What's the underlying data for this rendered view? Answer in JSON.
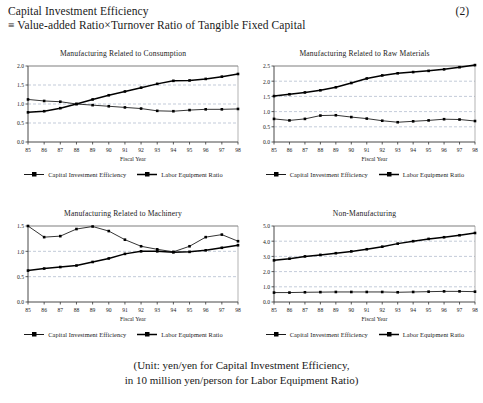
{
  "equation": {
    "line1": "Capital Investment Efficiency",
    "line2": "≡ Value‐added Ratio×Turnover Ratio of  Tangible Fixed Capital",
    "number": "(2)"
  },
  "legend": {
    "series1_label": "Capital Investment Efficiency",
    "series2_label": "Labor Equipment Ratio",
    "marker_icon": "filled-square-marker"
  },
  "footer": {
    "line1": "(Unit: yen/yen for Capital Investment Efficiency,",
    "line2": "in 10 million yen/person for Labor Equipment Ratio)"
  },
  "axis": {
    "xlabel": "Fiscal Year",
    "categories": [
      "85",
      "86",
      "87",
      "88",
      "89",
      "90",
      "91",
      "92",
      "93",
      "94",
      "95",
      "96",
      "97",
      "98"
    ]
  },
  "colors": {
    "line": "#000000",
    "grid": "#9aa7bf",
    "frame": "#808080",
    "text": "#1a1a1a"
  },
  "chart_data": [
    {
      "id": "consumption",
      "type": "line",
      "title": "Manufacturing Related to Consumption",
      "xlabel": "Fiscal Year",
      "ylabel": "",
      "categories": [
        "85",
        "86",
        "87",
        "88",
        "89",
        "90",
        "91",
        "92",
        "93",
        "94",
        "95",
        "96",
        "97",
        "98"
      ],
      "yticks": [
        0.0,
        0.5,
        1.0,
        1.5,
        2.0
      ],
      "ytick_labels": [
        "0.0",
        "0.5",
        "1.0",
        "1.5",
        "2.0"
      ],
      "ylim": [
        0.0,
        2.0
      ],
      "grid": true,
      "legend_position": "bottom",
      "series": [
        {
          "name": "Capital Investment Efficiency",
          "values": [
            1.12,
            1.08,
            1.06,
            1.0,
            0.97,
            0.94,
            0.91,
            0.88,
            0.82,
            0.81,
            0.84,
            0.86,
            0.86,
            0.87
          ]
        },
        {
          "name": "Labor Equipment Ratio",
          "values": [
            0.78,
            0.81,
            0.89,
            1.0,
            1.12,
            1.23,
            1.33,
            1.43,
            1.53,
            1.61,
            1.62,
            1.66,
            1.72,
            1.79
          ]
        }
      ]
    },
    {
      "id": "raw-materials",
      "type": "line",
      "title": "Manufacturing Related to Raw Materials",
      "xlabel": "Fiscal Year",
      "ylabel": "",
      "categories": [
        "85",
        "86",
        "87",
        "88",
        "89",
        "90",
        "91",
        "92",
        "93",
        "94",
        "95",
        "96",
        "97",
        "98"
      ],
      "yticks": [
        0.0,
        0.5,
        1.0,
        1.5,
        2.0,
        2.5
      ],
      "ytick_labels": [
        "0.0",
        "0.5",
        "1.0",
        "1.5",
        "2.0",
        "2.5"
      ],
      "ylim": [
        0.0,
        2.5
      ],
      "grid": true,
      "legend_position": "bottom",
      "series": [
        {
          "name": "Capital Investment Efficiency",
          "values": [
            0.76,
            0.71,
            0.76,
            0.87,
            0.88,
            0.82,
            0.77,
            0.7,
            0.65,
            0.68,
            0.71,
            0.75,
            0.74,
            0.69
          ]
        },
        {
          "name": "Labor Equipment Ratio",
          "values": [
            1.51,
            1.57,
            1.63,
            1.7,
            1.8,
            1.94,
            2.09,
            2.19,
            2.26,
            2.3,
            2.34,
            2.39,
            2.46,
            2.53
          ]
        }
      ]
    },
    {
      "id": "machinery",
      "type": "line",
      "title": "Manufacturing Related to Machinery",
      "xlabel": "Fiscal Year",
      "ylabel": "",
      "categories": [
        "85",
        "86",
        "87",
        "88",
        "89",
        "90",
        "91",
        "92",
        "93",
        "94",
        "95",
        "96",
        "97",
        "98"
      ],
      "yticks": [
        0.0,
        0.5,
        1.0,
        1.5
      ],
      "ytick_labels": [
        "0.0",
        "0.5",
        "1.0",
        "1.5"
      ],
      "ylim": [
        0.0,
        1.5
      ],
      "grid": true,
      "legend_position": "bottom",
      "series": [
        {
          "name": "Capital Investment Efficiency",
          "values": [
            1.5,
            1.28,
            1.3,
            1.44,
            1.49,
            1.4,
            1.23,
            1.1,
            1.04,
            0.99,
            1.1,
            1.28,
            1.33,
            1.2
          ]
        },
        {
          "name": "Labor Equipment Ratio",
          "values": [
            0.62,
            0.66,
            0.69,
            0.72,
            0.79,
            0.86,
            0.95,
            1.0,
            1.0,
            0.98,
            0.99,
            1.02,
            1.07,
            1.12
          ]
        }
      ]
    },
    {
      "id": "non-manufacturing",
      "type": "line",
      "title": "Non-Manufacturing",
      "xlabel": "Fiscal Year",
      "ylabel": "",
      "categories": [
        "85",
        "86",
        "87",
        "88",
        "89",
        "90",
        "91",
        "92",
        "93",
        "94",
        "95",
        "96",
        "97",
        "98"
      ],
      "yticks": [
        0.0,
        1.0,
        2.0,
        3.0,
        4.0,
        5.0
      ],
      "ytick_labels": [
        "0.0",
        "1.0",
        "2.0",
        "3.0",
        "4.0",
        "5.0"
      ],
      "ylim": [
        0.0,
        5.0
      ],
      "grid": true,
      "legend_position": "bottom",
      "series": [
        {
          "name": "Capital Investment Efficiency",
          "values": [
            0.62,
            0.62,
            0.64,
            0.65,
            0.66,
            0.66,
            0.66,
            0.66,
            0.64,
            0.66,
            0.68,
            0.7,
            0.7,
            0.68
          ]
        },
        {
          "name": "Labor Equipment Ratio",
          "values": [
            2.74,
            2.85,
            3.0,
            3.1,
            3.21,
            3.33,
            3.47,
            3.64,
            3.84,
            4.0,
            4.15,
            4.26,
            4.39,
            4.54
          ]
        }
      ]
    }
  ]
}
